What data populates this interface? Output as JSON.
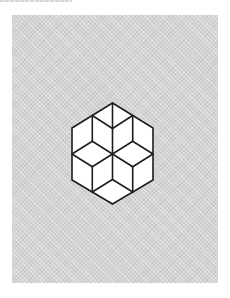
{
  "figure": {
    "type": "hexagon-cube-dissection",
    "colors": {
      "page_background": "#ffffff",
      "panel_background": "#d3d3d3",
      "shape_fill": "#ffffff",
      "stroke": "#1e1e1e"
    },
    "stroke_width": 1.6,
    "outer_hexagon": [
      [
        112.5,
        103
      ],
      [
        153,
        128
      ],
      [
        153,
        180
      ],
      [
        112.5,
        204
      ],
      [
        72,
        180
      ],
      [
        72,
        128
      ]
    ],
    "segments": [
      [
        [
          112.5,
          103
        ],
        [
          112.5,
          128.5
        ]
      ],
      [
        [
          112.5,
          128.5
        ],
        [
          112.5,
          154
        ]
      ],
      [
        [
          92.3,
          115.5
        ],
        [
          112.5,
          128.5
        ]
      ],
      [
        [
          132.7,
          115.5
        ],
        [
          112.5,
          128.5
        ]
      ],
      [
        [
          92.3,
          115.5
        ],
        [
          92.3,
          141.3
        ]
      ],
      [
        [
          132.7,
          115.5
        ],
        [
          132.7,
          141.3
        ]
      ],
      [
        [
          72,
          154
        ],
        [
          92.3,
          141.3
        ]
      ],
      [
        [
          72,
          154
        ],
        [
          92.3,
          166.8
        ]
      ],
      [
        [
          153,
          154
        ],
        [
          132.7,
          141.3
        ]
      ],
      [
        [
          153,
          154
        ],
        [
          132.7,
          166.8
        ]
      ],
      [
        [
          92.3,
          141.3
        ],
        [
          112.5,
          154
        ]
      ],
      [
        [
          132.7,
          141.3
        ],
        [
          112.5,
          154
        ]
      ],
      [
        [
          92.3,
          166.8
        ],
        [
          112.5,
          154
        ]
      ],
      [
        [
          132.7,
          166.8
        ],
        [
          112.5,
          154
        ]
      ],
      [
        [
          92.3,
          166.8
        ],
        [
          92.3,
          192
        ]
      ],
      [
        [
          132.7,
          166.8
        ],
        [
          132.7,
          192
        ]
      ],
      [
        [
          112.5,
          154
        ],
        [
          112.5,
          179.5
        ]
      ],
      [
        [
          112.5,
          179.5
        ],
        [
          92.3,
          192
        ]
      ],
      [
        [
          112.5,
          179.5
        ],
        [
          132.7,
          192
        ]
      ]
    ]
  }
}
